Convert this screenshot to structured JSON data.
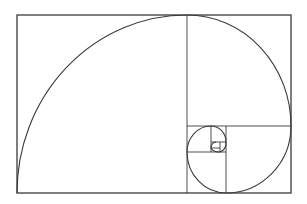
{
  "diagram": {
    "stroke_color": "#3a3a3a",
    "background": "#ffffff",
    "outer_rect": {
      "x": 17,
      "y": 15,
      "w": 274,
      "h": 178
    },
    "divisions": [
      {
        "type": "v",
        "x": 187,
        "y1": 15,
        "y2": 193
      },
      {
        "type": "h",
        "y": 126,
        "x1": 187,
        "x2": 291
      },
      {
        "type": "v",
        "x": 226,
        "y1": 126,
        "y2": 193
      },
      {
        "type": "h",
        "y": 152,
        "x1": 187,
        "x2": 226
      },
      {
        "type": "v",
        "x": 211,
        "y1": 126,
        "y2": 152
      },
      {
        "type": "h",
        "y": 142,
        "x1": 211,
        "x2": 226
      },
      {
        "type": "v",
        "x": 220,
        "y1": 142,
        "y2": 152
      },
      {
        "type": "h",
        "y": 148,
        "x1": 211,
        "x2": 220
      }
    ]
  }
}
